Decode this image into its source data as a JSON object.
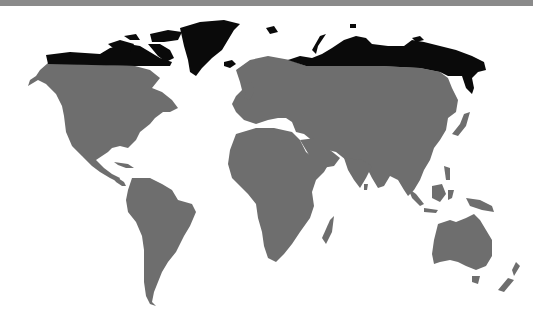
{
  "map": {
    "type": "world-map",
    "projection": "equirectangular-like",
    "highlight_description": "Arctic regions (northern Canada, Greenland, northern Russia/Siberia) shaded black; rest of land gray",
    "colors": {
      "background": "#ffffff",
      "top_band": "#8a8a8a",
      "land": "#6e6e6e",
      "highlighted_land": "#0a0a0a"
    },
    "legend": []
  }
}
